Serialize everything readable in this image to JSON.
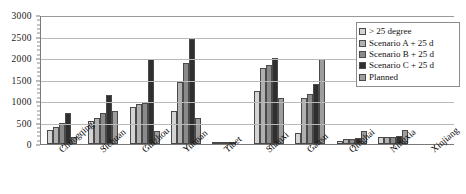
{
  "chart_data": {
    "type": "bar",
    "title": "",
    "xlabel": "",
    "ylabel": "",
    "ylim": [
      0,
      3000
    ],
    "ytick_step": 500,
    "ytick_labels": [
      "0",
      "500",
      "1000",
      "1500",
      "2000",
      "2500",
      "3000"
    ],
    "grid": true,
    "legend_position": "upper right",
    "categories": [
      "Chongqing",
      "Sichuan",
      "Guizhou",
      "Yunnan",
      "Tibet",
      "Shanxi",
      "Gansu",
      "Qinghai",
      "Ningxia",
      "Xinjiang"
    ],
    "series": [
      {
        "name": "> 25 degree",
        "color": "#d4d4d4",
        "values": [
          330,
          540,
          870,
          770,
          10,
          1240,
          250,
          80,
          160,
          0
        ]
      },
      {
        "name": "Scenario A + 25 d",
        "color": "#b0b0b0",
        "values": [
          400,
          610,
          940,
          1440,
          10,
          1760,
          1080,
          110,
          165,
          0
        ]
      },
      {
        "name": "Scenario B + 25 d",
        "color": "#8a8a8a",
        "values": [
          490,
          710,
          950,
          1890,
          15,
          1830,
          1170,
          120,
          170,
          0
        ]
      },
      {
        "name": "Scenario C + 25 d",
        "color": "#2f2f2f",
        "values": [
          710,
          1130,
          1980,
          2450,
          20,
          1990,
          1390,
          130,
          175,
          0
        ]
      },
      {
        "name": "Planned",
        "color": "#9d9d9d",
        "values": [
          160,
          760,
          310,
          600,
          0,
          1080,
          1980,
          310,
          320,
          0
        ]
      }
    ]
  },
  "axis": {
    "y_axis_color": "#7a7a7a",
    "grid_color": "#b9b9b9"
  }
}
